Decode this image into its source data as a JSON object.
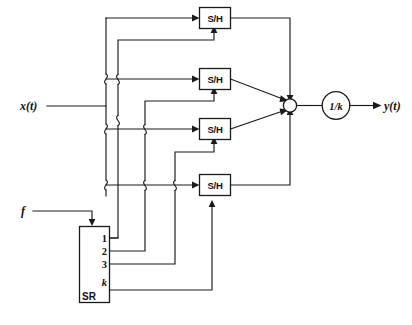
{
  "diagram": {
    "colors": {
      "line": "#1a1a1a",
      "fill": "#ffffff",
      "text": "#111111"
    },
    "signals": {
      "input_label": "x(t)",
      "output_label": "y(t)",
      "clock_label": "f"
    },
    "blocks": {
      "sample_hold_label": "S/H",
      "sample_hold_count": 4,
      "gain_label": "1/k",
      "shift_register_label": "SR",
      "summing_junction_label": ""
    },
    "shift_register": {
      "name": "SR",
      "taps": [
        {
          "label": "1"
        },
        {
          "label": "2"
        },
        {
          "label": "3"
        },
        {
          "label": "k"
        }
      ]
    },
    "sample_hold_units": [
      {
        "label": "S/H",
        "index": 1
      },
      {
        "label": "S/H",
        "index": 2
      },
      {
        "label": "S/H",
        "index": 3
      },
      {
        "label": "S/H",
        "index": 4
      }
    ]
  }
}
